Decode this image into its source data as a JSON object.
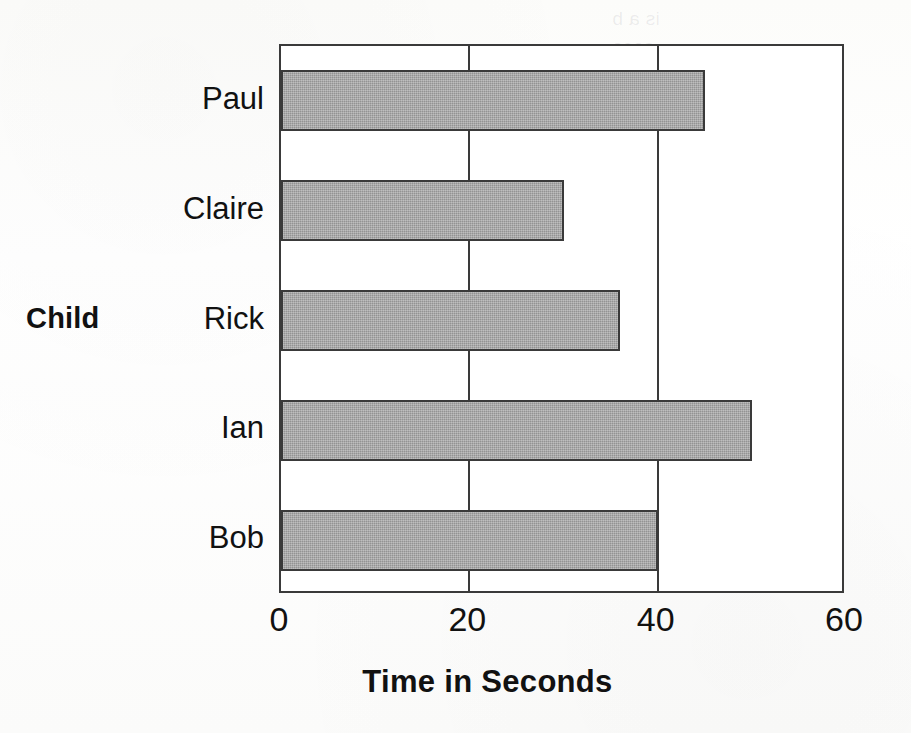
{
  "chart_data": {
    "type": "bar",
    "orientation": "horizontal",
    "title": "",
    "xlabel": "Time in Seconds",
    "ylabel": "Child",
    "categories": [
      "Bob",
      "Ian",
      "Rick",
      "Claire",
      "Paul"
    ],
    "values": [
      40,
      50,
      36,
      30,
      45
    ],
    "xlim": [
      0,
      60
    ],
    "xticks": [
      0,
      20,
      40,
      60
    ],
    "xtick_labels": [
      "0",
      "20",
      "40",
      "60"
    ],
    "grid": "vertical",
    "legend": "none",
    "bar_color": "#a3a3a3",
    "bar_edge_color": "#3a3a3a",
    "axis_color": "#3a3a3a",
    "background_color": "#ffffff"
  },
  "axes": {
    "y_title": "Child",
    "x_title": "Time in Seconds"
  },
  "bars_top_to_bottom": [
    {
      "label": "Paul",
      "value": 45
    },
    {
      "label": "Claire",
      "value": 30
    },
    {
      "label": "Rick",
      "value": 36
    },
    {
      "label": "Ian",
      "value": 50
    },
    {
      "label": "Bob",
      "value": 40
    }
  ],
  "ghost_bleed_text": {
    "line1": "is a b",
    "line2": "seco",
    "line3": "is",
    "line4": "pa",
    "line5": "sec"
  }
}
